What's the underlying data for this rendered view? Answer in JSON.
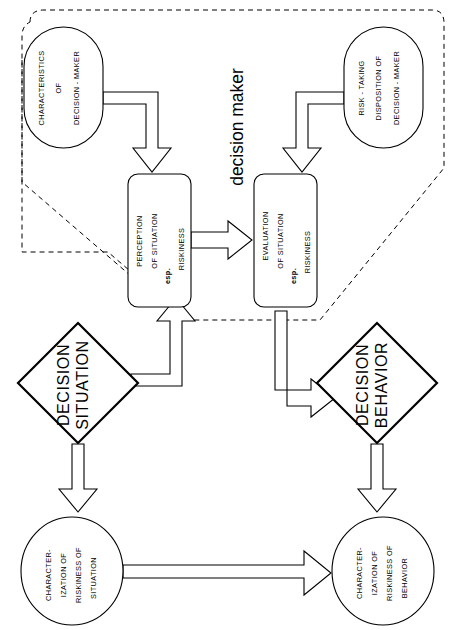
{
  "figure": {
    "type": "flow-diagram",
    "background": "#ffffff",
    "line_color": "#000000",
    "orientation": "rotated-90-ccw-text"
  },
  "region": {
    "label": "decision maker",
    "style": "dashed-rounded-boundary"
  },
  "nodes": {
    "characteristics": {
      "id": "characteristics-of-decision-maker",
      "shape": "stadium",
      "lines": [
        "CHARACTERISTICS",
        "OF",
        "DECISION - MAKER"
      ]
    },
    "risk_taking": {
      "id": "risk-taking-disposition-of-decision-maker",
      "shape": "stadium",
      "lines": [
        "RISK - TAKING",
        "DISPOSITION OF",
        "DECISION - MAKER"
      ]
    },
    "perception": {
      "id": "perception-of-situation",
      "shape": "rounded-rect",
      "lines": [
        "PERCEPTION",
        "OF SITUATION",
        "esp.",
        "RISKINESS"
      ],
      "bold_line_index": 2
    },
    "evaluation": {
      "id": "evaluation-of-situation",
      "shape": "rounded-rect",
      "lines": [
        "EVALUATION",
        "OF SITUATION",
        "esp.",
        "RISKINESS"
      ],
      "bold_line_index": 2
    },
    "decision_situation": {
      "id": "decision-situation",
      "shape": "diamond",
      "lines": [
        "DECISION",
        "SITUATION"
      ]
    },
    "decision_behavior": {
      "id": "decision-behavior",
      "shape": "diamond",
      "lines": [
        "DECISION",
        "BEHAVIOR"
      ]
    },
    "char_situation": {
      "id": "characterization-of-riskiness-of-situation",
      "shape": "ellipse",
      "lines": [
        "CHARACTER-",
        "IZATION OF",
        "RISKINESS OF",
        "SITUATION"
      ]
    },
    "char_behavior": {
      "id": "characterization-of-riskiness-of-behavior",
      "shape": "ellipse",
      "lines": [
        "CHARACTER-",
        "IZATION OF",
        "RISKINESS OF",
        "BEHAVIOR"
      ]
    }
  },
  "edges": [
    {
      "id": "characteristics-to-perception",
      "from": "characteristics",
      "to": "perception",
      "style": "hollow-block-arrow"
    },
    {
      "id": "risk-taking-to-evaluation",
      "from": "risk_taking",
      "to": "evaluation",
      "style": "hollow-block-arrow"
    },
    {
      "id": "perception-to-evaluation",
      "from": "perception",
      "to": "evaluation",
      "style": "hollow-block-arrow"
    },
    {
      "id": "decision-situation-to-perception",
      "from": "decision_situation",
      "to": "perception",
      "style": "hollow-block-arrow"
    },
    {
      "id": "evaluation-to-decision-behavior",
      "from": "evaluation",
      "to": "decision_behavior",
      "style": "hollow-block-arrow"
    },
    {
      "id": "decision-situation-to-char-situation",
      "from": "decision_situation",
      "to": "char_situation",
      "style": "hollow-block-arrow"
    },
    {
      "id": "decision-behavior-to-char-behavior",
      "from": "decision_behavior",
      "to": "char_behavior",
      "style": "hollow-block-arrow"
    },
    {
      "id": "char-situation-to-char-behavior",
      "from": "char_situation",
      "to": "char_behavior",
      "style": "hollow-block-arrow"
    }
  ]
}
